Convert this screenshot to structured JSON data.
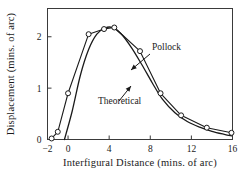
{
  "chart_data": {
    "type": "line",
    "title": "",
    "xlabel": "Interfigural Distance (mins. of arc)",
    "ylabel": "Displacement (mins. of arc)",
    "xlim": [
      -2,
      16
    ],
    "ylim": [
      0,
      2.55
    ],
    "xticks": [
      -2,
      0,
      4,
      8,
      12,
      16
    ],
    "xtick_labels": [
      "−2",
      "0",
      "4",
      "8",
      "12",
      "16"
    ],
    "yticks": [
      0,
      1,
      2
    ],
    "ytick_labels": [
      "0",
      "1",
      "2"
    ],
    "grid": false,
    "legend": "inline-annotations",
    "frame": "box",
    "series": [
      {
        "name": "Pollock",
        "style": "line-with-open-circle-markers",
        "marker": "open-circle",
        "color": "#1a1a1a",
        "x": [
          -1.6,
          -1.0,
          0.0,
          2.0,
          3.5,
          4.5,
          7.0,
          9.0,
          11.0,
          13.5,
          15.9
        ],
        "y": [
          0.02,
          0.15,
          0.9,
          2.05,
          2.15,
          2.18,
          1.72,
          0.9,
          0.47,
          0.23,
          0.13
        ]
      },
      {
        "name": "Theoretical",
        "style": "smooth-line",
        "marker": "none",
        "color": "#1a1a1a",
        "x": [
          -0.35,
          0.4,
          1.2,
          2.0,
          2.8,
          3.6,
          4.3,
          5.2,
          6.2,
          7.2,
          8.2,
          9.2,
          10.4,
          11.6,
          12.8,
          14.0,
          15.2,
          15.9
        ],
        "y": [
          0.0,
          0.55,
          1.25,
          1.75,
          2.05,
          2.17,
          2.18,
          2.05,
          1.78,
          1.45,
          1.1,
          0.78,
          0.52,
          0.35,
          0.24,
          0.16,
          0.1,
          0.07
        ]
      }
    ],
    "annotations": [
      {
        "text": "Pollock",
        "x_px": 152,
        "y_px": 50,
        "arrow_from_px": [
          150,
          54
        ],
        "arrow_to_px": [
          131,
          70
        ],
        "target_series": "Pollock"
      },
      {
        "text": "Theoretical",
        "x_px": 98,
        "y_px": 104,
        "arrow_from_px": [
          119,
          101
        ],
        "arrow_to_px": [
          131,
          86
        ],
        "target_series": "Theoretical"
      }
    ]
  }
}
